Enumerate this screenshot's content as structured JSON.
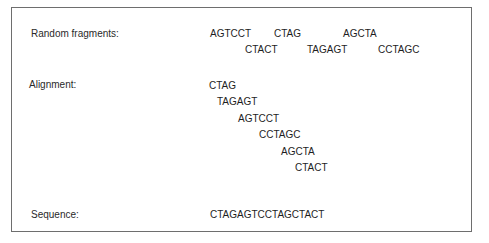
{
  "labels": {
    "random_fragments": "Random fragments:",
    "alignment": "Alignment:",
    "sequence": "Sequence:"
  },
  "random_fragments": [
    {
      "text": "AGTCCT",
      "x": 210,
      "y": 28
    },
    {
      "text": "CTAG",
      "x": 274,
      "y": 28
    },
    {
      "text": "AGCTA",
      "x": 343,
      "y": 28
    },
    {
      "text": "CTACT",
      "x": 245,
      "y": 44
    },
    {
      "text": "TAGAGT",
      "x": 307,
      "y": 44
    },
    {
      "text": "CCTAGC",
      "x": 378,
      "y": 44
    }
  ],
  "alignment": [
    {
      "text": "CTAG",
      "x": 209,
      "y": 80
    },
    {
      "text": "TAGAGT",
      "x": 217,
      "y": 96
    },
    {
      "text": "AGTCCT",
      "x": 238,
      "y": 113
    },
    {
      "text": "CCTAGC",
      "x": 259,
      "y": 129
    },
    {
      "text": "AGCTA",
      "x": 281,
      "y": 146
    },
    {
      "text": "CTACT",
      "x": 295,
      "y": 162
    }
  ],
  "sequence": "CTAGAGTCCTAGCTACT"
}
